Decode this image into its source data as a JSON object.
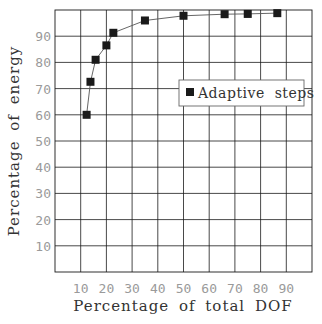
{
  "chart_data": {
    "type": "line",
    "title": "",
    "xlabel": "Percentage of total DOF",
    "ylabel": "Percentage of energy",
    "xlim": [
      0,
      100
    ],
    "ylim": [
      0,
      100
    ],
    "grid": true,
    "xticks": [
      10,
      20,
      30,
      40,
      50,
      60,
      70,
      80,
      90
    ],
    "yticks": [
      10,
      20,
      30,
      40,
      50,
      60,
      70,
      80,
      90
    ],
    "xtick_labels": [
      "10",
      "20",
      "30",
      "40",
      "50",
      "60",
      "70",
      "80",
      "90"
    ],
    "ytick_labels": [
      "10",
      "20",
      "30",
      "40",
      "50",
      "60",
      "70",
      "80",
      "90"
    ],
    "legend": {
      "placement": "center-right",
      "entries": [
        "Adaptive steps"
      ]
    },
    "series": [
      {
        "name": "Adaptive steps",
        "marker": "square",
        "x": [
          12.3,
          13.8,
          15.8,
          20.0,
          22.7,
          35.0,
          50.0,
          66.0,
          75.0,
          86.5
        ],
        "y": [
          60.0,
          72.6,
          81.0,
          86.5,
          91.3,
          96.0,
          97.8,
          98.4,
          98.5,
          98.8
        ]
      }
    ]
  }
}
